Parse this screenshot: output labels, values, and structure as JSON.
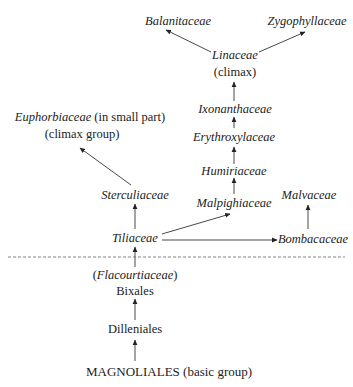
{
  "diagram": {
    "type": "phylogeny",
    "nodes": {
      "balanitaceae": {
        "label": "Balanitaceae"
      },
      "zygophyllaceae": {
        "label": "Zygophyllaceae"
      },
      "linaceae": {
        "label": "Linaceae",
        "note": "(climax)"
      },
      "ixonanthaceae": {
        "label": "Ixonanthaceae"
      },
      "erythroxylaceae": {
        "label": "Erythroxylaceae"
      },
      "humiriaceae": {
        "label": "Humiriaceae"
      },
      "malpighiaceae": {
        "label": "Malpighiaceae"
      },
      "euphorbiaceae": {
        "label": "Euphorbiaceae",
        "qualifier": "(in small part)",
        "note": "(climax group)"
      },
      "sterculiaceae": {
        "label": "Sterculiaceae"
      },
      "malvaceae": {
        "label": "Malvaceae"
      },
      "tiliaceae": {
        "label": "Tiliaceae"
      },
      "bombacaceae": {
        "label": "Bombacaceae"
      },
      "flacourtiaceae": {
        "label": "Flacourtiaceae",
        "open": "(",
        "close": ")"
      },
      "bixales": {
        "label": "Bixales"
      },
      "dilleniales": {
        "label": "Dilleniales"
      },
      "magnoliales": {
        "label": "MAGNOLIALES (basic group)"
      }
    },
    "edges": [
      [
        "magnoliales",
        "dilleniales"
      ],
      [
        "dilleniales",
        "bixales"
      ],
      [
        "bixales",
        "tiliaceae"
      ],
      [
        "tiliaceae",
        "sterculiaceae"
      ],
      [
        "tiliaceae",
        "malpighiaceae"
      ],
      [
        "tiliaceae",
        "bombacaceae"
      ],
      [
        "bombacaceae",
        "malvaceae"
      ],
      [
        "sterculiaceae",
        "euphorbiaceae"
      ],
      [
        "malpighiaceae",
        "humiriaceae"
      ],
      [
        "humiriaceae",
        "erythroxylaceae"
      ],
      [
        "erythroxylaceae",
        "ixonanthaceae"
      ],
      [
        "ixonanthaceae",
        "linaceae"
      ],
      [
        "linaceae",
        "balanitaceae"
      ],
      [
        "linaceae",
        "zygophyllaceae"
      ]
    ],
    "divider": "dashed"
  }
}
